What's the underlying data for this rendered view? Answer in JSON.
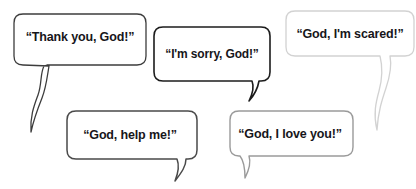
{
  "scene": {
    "title": "Speech bubbles of prayers",
    "background_color": "#ffffff",
    "text_color": "#17161a"
  },
  "bubbles": [
    {
      "id": "thank-you-god",
      "text": "“Thank you, God!”",
      "border_color": "#3c3c3c",
      "tail": "long-wavy-down-left",
      "position": "top-left"
    },
    {
      "id": "im-sorry-god",
      "text": "“I'm sorry, God!”",
      "border_color": "#1c1c1c",
      "tail": "short-hook-down-right",
      "position": "top-center"
    },
    {
      "id": "god-im-scared",
      "text": "“God, I'm scared!”",
      "border_color": "#d2d2d2",
      "tail": "long-wavy-down-right",
      "position": "top-right"
    },
    {
      "id": "god-help-me",
      "text": "“God, help me!”",
      "border_color": "#4a4a4a",
      "tail": "short-hook-down-right",
      "position": "bottom-left"
    },
    {
      "id": "god-i-love-you",
      "text": "“God, I love you!”",
      "border_color": "#9a9a9a",
      "tail": "short-hook-down-left",
      "position": "bottom-center"
    }
  ]
}
